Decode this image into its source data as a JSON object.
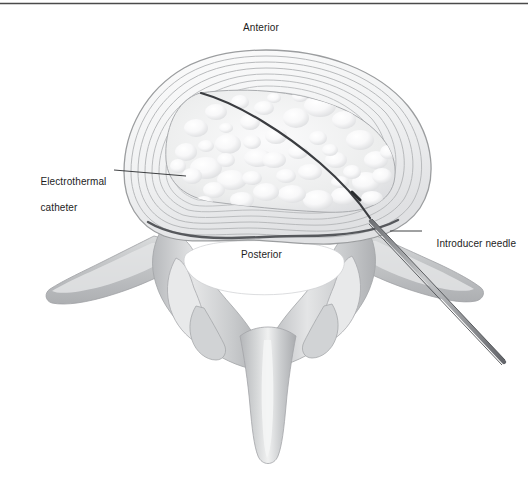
{
  "figure": {
    "kind": "medical-illustration",
    "background_color": "#ffffff",
    "top_rule_color": "#4a4a4a"
  },
  "orientation_labels": {
    "anterior": "Anterior",
    "posterior": "Posterior"
  },
  "callouts": [
    {
      "id": "electrothermal-catheter",
      "line1": "Electrothermal",
      "line2": "catheter",
      "text": "Electrothermal catheter",
      "leader_from_x": 114,
      "leader_from_y": 170,
      "leader_to_x": 186,
      "leader_to_y": 176
    },
    {
      "id": "introducer-needle",
      "line1": "Introducer needle",
      "line2": "",
      "text": "Introducer needle",
      "leader_from_x": 422,
      "leader_from_y": 231,
      "leader_to_x": 390,
      "leader_to_y": 231
    }
  ],
  "anatomy": {
    "annulus_fibrosus": {
      "name": "annulus-fibrosus",
      "description": "concentric lamellar rings of the outer disc",
      "ring_color": "#b6b8ba",
      "ring_count": 9,
      "fill_color": "#f3f4f5"
    },
    "nucleus_pulposus": {
      "name": "nucleus-pulposus",
      "description": "central gelatinous core with bubbled texture",
      "fill_color": "#ededef",
      "highlight_color": "#ffffff",
      "bubble_count": 46
    },
    "posterior_disc_border": {
      "name": "posterior-disc-border",
      "color": "#56585c"
    },
    "vertebral_canal": {
      "name": "vertebral-canal",
      "fill_color": "#ffffff"
    },
    "bone": {
      "name": "vertebral-arch-bone",
      "base_fill": "#c2c4c6",
      "mid_fill": "#d3d5d7",
      "light_fill": "#e9eaeb",
      "edge_color": "#a8aaac"
    },
    "processes": [
      {
        "name": "left-transverse-process",
        "tip_x": 48,
        "tip_y": 296
      },
      {
        "name": "right-transverse-process",
        "tip_x": 482,
        "tip_y": 294
      },
      {
        "name": "left-superior-articular-process",
        "tip_x": 168,
        "tip_y": 330
      },
      {
        "name": "right-superior-articular-process",
        "tip_x": 360,
        "tip_y": 330
      },
      {
        "name": "spinous-process",
        "tip_x": 268,
        "tip_y": 464
      }
    ]
  },
  "instruments": {
    "catheter": {
      "name": "electrothermal-catheter",
      "color": "#3a3c40",
      "width_px": 2.2,
      "tip_x": 201,
      "tip_y": 93,
      "entry_x": 367,
      "entry_y": 218
    },
    "needle": {
      "name": "introducer-needle",
      "outline_color": "#55575b",
      "fill_color": "#9a9c9f",
      "hub_x": 504,
      "hub_y": 362,
      "tip_x": 371,
      "tip_y": 221
    }
  }
}
